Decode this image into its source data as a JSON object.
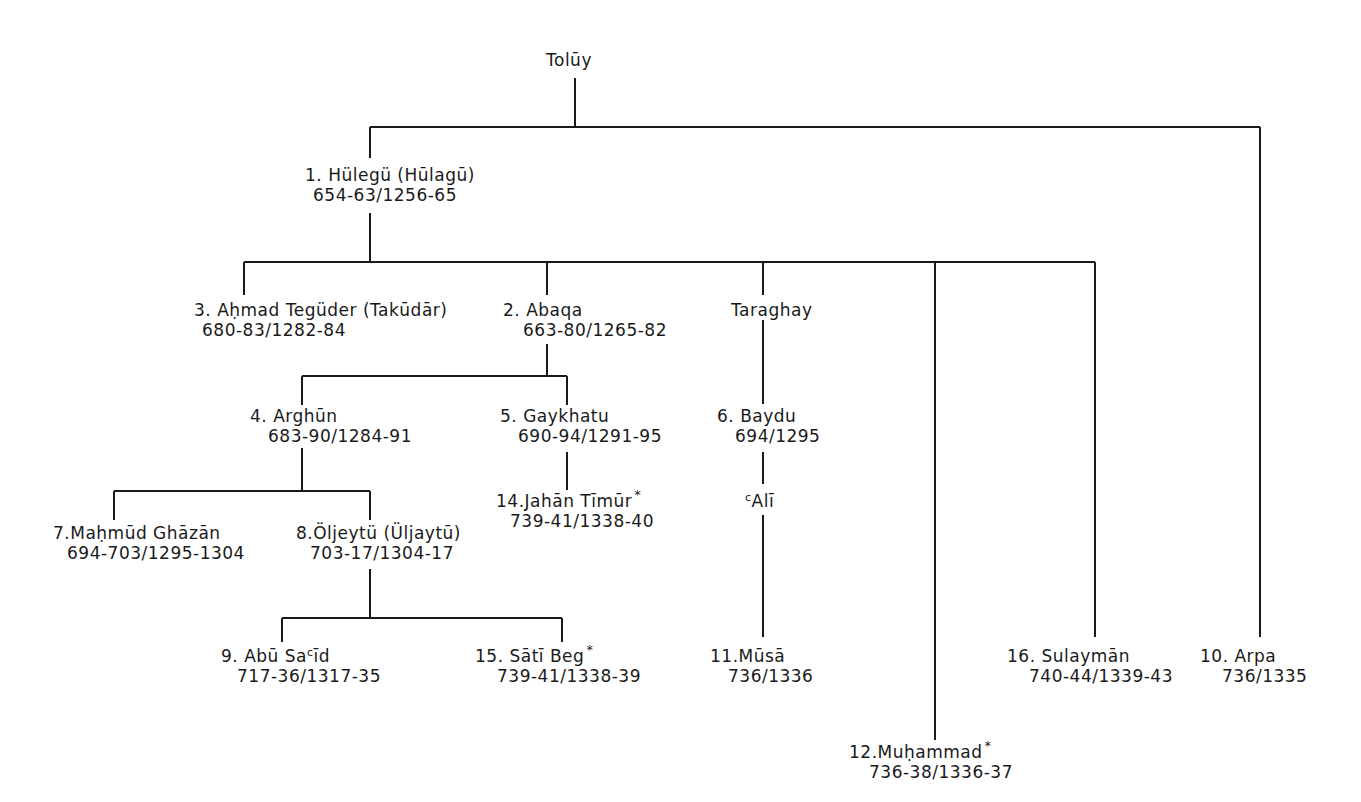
{
  "diagram": {
    "root": {
      "name": "Tolūy"
    },
    "nodes": {
      "hulegu": {
        "number": "1.",
        "name": "Hülegü (Hūlagū)",
        "dates": "654-63/1256-65",
        "star": ""
      },
      "ahmad": {
        "number": "3.",
        "name": "Aḥmad Tegüder (Takūdār)",
        "dates": "680-83/1282-84",
        "star": ""
      },
      "abaqa": {
        "number": "2.",
        "name": "Abaqa",
        "dates": "663-80/1265-82",
        "star": ""
      },
      "taraghay": {
        "number": "",
        "name": "Taraghay",
        "dates": "",
        "star": ""
      },
      "arghun": {
        "number": "4.",
        "name": "Arghūn",
        "dates": "683-90/1284-91",
        "star": ""
      },
      "gaykhatu": {
        "number": "5.",
        "name": "Gaykhatu",
        "dates": "690-94/1291-95",
        "star": ""
      },
      "baydu": {
        "number": "6.",
        "name": "Baydu",
        "dates": "694/1295",
        "star": ""
      },
      "ghazan": {
        "number": "7.",
        "name": "Maḥmūd Ghāzān",
        "dates": "694-703/1295-1304",
        "star": ""
      },
      "oljeytu": {
        "number": "8.",
        "name": "Öljeytü (Üljaytū)",
        "dates": "703-17/1304-17",
        "star": ""
      },
      "jahan": {
        "number": "14.",
        "name": "Jahān Tīmūr",
        "dates": "739-41/1338-40",
        "star": "*"
      },
      "ali": {
        "prefix": "c",
        "name": "Alī"
      },
      "abusaid": {
        "number": "9.",
        "name_a": "Abū Sa",
        "prefix": "c",
        "name_b": "īd",
        "dates": "717-36/1317-35",
        "star": ""
      },
      "sati": {
        "number": "15.",
        "name": "Sātī Beg",
        "dates": "739-41/1338-39",
        "star": "*"
      },
      "musa": {
        "number": "11.",
        "name": "Mūsā",
        "dates": "736/1336",
        "star": ""
      },
      "muhammad": {
        "number": "12.",
        "name": "Muḥammad",
        "dates": "736-38/1336-37",
        "star": "*"
      },
      "sulayman": {
        "number": "16.",
        "name": "Sulaymān",
        "dates": "740-44/1339-43",
        "star": ""
      },
      "arpa": {
        "number": "10.",
        "name": "Arpa",
        "dates": "736/1335",
        "star": ""
      }
    }
  }
}
